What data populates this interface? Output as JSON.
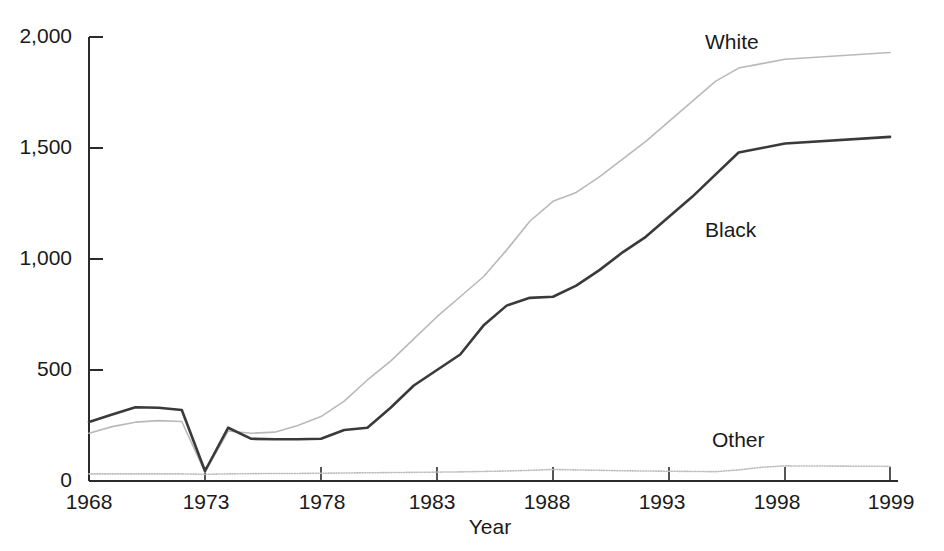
{
  "chart_data": {
    "type": "line",
    "title": "",
    "subtitle": "",
    "xlabel": "Year",
    "ylabel": "",
    "grid": false,
    "legend_position": "inline-series-labels",
    "xlim": [
      1968,
      1999
    ],
    "ylim": [
      0,
      2000
    ],
    "y_ticks": [
      0,
      500,
      1000,
      1500,
      2000
    ],
    "y_tick_labels": [
      "0",
      "500",
      "1,000",
      "1,500",
      "2,000"
    ],
    "x_ticks": [
      1968,
      1973,
      1978,
      1983,
      1988,
      1993,
      1998,
      1999
    ],
    "x_tick_labels": [
      "1968",
      "1973",
      "1978",
      "1983",
      "1988",
      "1993",
      "1998",
      "1999"
    ],
    "x": [
      1968,
      1969,
      1970,
      1971,
      1972,
      1973,
      1974,
      1975,
      1976,
      1977,
      1978,
      1979,
      1980,
      1981,
      1982,
      1983,
      1984,
      1985,
      1986,
      1987,
      1988,
      1989,
      1990,
      1991,
      1992,
      1993,
      1994,
      1995,
      1996,
      1997,
      1998,
      1999
    ],
    "series": [
      {
        "name": "White",
        "color": "#b9b9b9",
        "style": "solid-thin",
        "values": [
          215,
          245,
          265,
          272,
          268,
          40,
          225,
          215,
          220,
          250,
          290,
          360,
          455,
          540,
          640,
          740,
          830,
          920,
          1040,
          1170,
          1260,
          1300,
          1370,
          1450,
          1530,
          1620,
          1710,
          1800,
          1860,
          1880,
          1900,
          1930
        ]
      },
      {
        "name": "Black",
        "color": "#3a3a3a",
        "style": "solid-thick",
        "values": [
          266,
          300,
          332,
          330,
          320,
          45,
          240,
          190,
          188,
          188,
          190,
          230,
          240,
          330,
          430,
          500,
          570,
          700,
          790,
          825,
          830,
          880,
          950,
          1030,
          1100,
          1190,
          1280,
          1380,
          1480,
          1500,
          1520,
          1550
        ]
      },
      {
        "name": "Other",
        "color": "#bdbdbd",
        "style": "dotted-thin",
        "values": [
          32,
          32,
          32,
          32,
          32,
          30,
          32,
          33,
          34,
          34,
          35,
          36,
          37,
          38,
          39,
          40,
          41,
          43,
          45,
          48,
          52,
          50,
          48,
          46,
          45,
          44,
          43,
          42,
          50,
          62,
          68,
          66
        ]
      }
    ],
    "annotations": [
      {
        "text": "White",
        "x": 1991.0,
        "y": 2010
      },
      {
        "text": "Black",
        "x": 1991.0,
        "y": 1150
      },
      {
        "text": "Other",
        "x": 1993.3,
        "y": 210
      }
    ]
  },
  "axis": {
    "x_title": "Year"
  }
}
